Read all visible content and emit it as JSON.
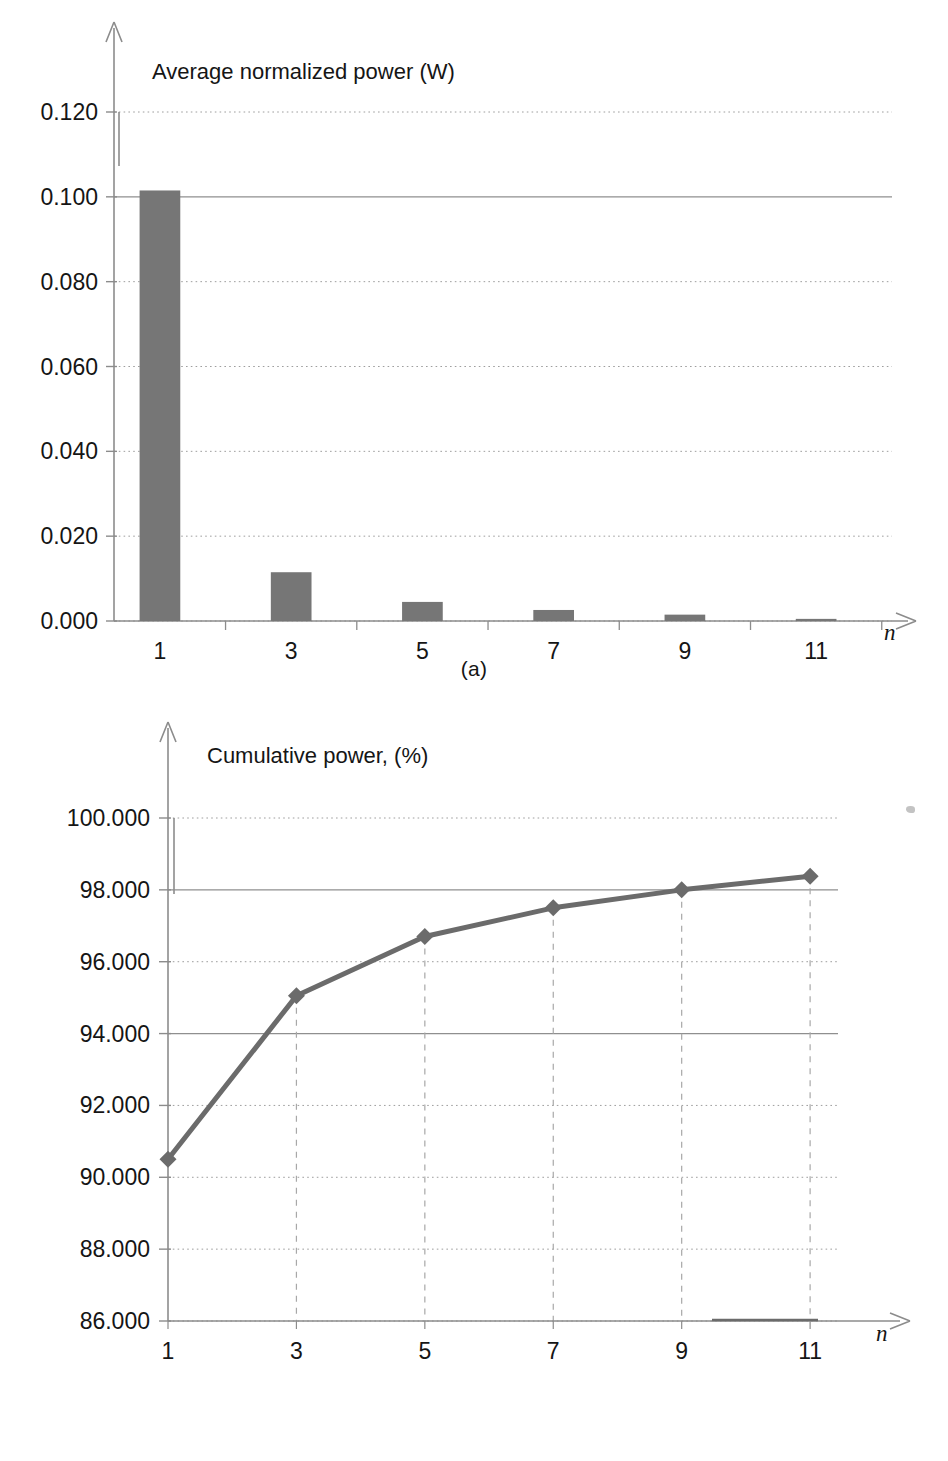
{
  "figure": {
    "panel_a_caption": "(a)",
    "panel_b_caption": "(b)",
    "bar_color": "#767676",
    "line_color": "#6b6b6b",
    "axis_color": "#8c8c8c",
    "grid_color": "#9a9a9a",
    "text_color": "#151515"
  },
  "chart_data": [
    {
      "id": "panel-a",
      "type": "bar",
      "title": "Average normalized power (W)",
      "xlabel": "n",
      "ylabel": "",
      "categories": [
        1,
        2,
        3,
        4,
        5,
        6,
        7,
        8,
        9,
        10,
        11
      ],
      "values": [
        0.1015,
        0.0,
        0.0115,
        0.0,
        0.0045,
        0.0,
        0.0026,
        0.0,
        0.0015,
        0.0,
        0.0005
      ],
      "xtick_labels": [
        "1",
        "3",
        "5",
        "7",
        "9",
        "11"
      ],
      "xtick_values": [
        1,
        3,
        5,
        7,
        9,
        11
      ],
      "ytick_labels": [
        "0.000",
        "0.020",
        "0.040",
        "0.060",
        "0.080",
        "0.100",
        "0.120"
      ],
      "ytick_values": [
        0.0,
        0.02,
        0.04,
        0.06,
        0.08,
        0.1,
        0.12
      ],
      "ylim": [
        0.0,
        0.132
      ],
      "xlim": [
        0.3,
        12.4
      ],
      "grid": true,
      "legend": "none",
      "caption": "(a)"
    },
    {
      "id": "panel-b",
      "type": "line",
      "title": "Cumulative power, (%)",
      "xlabel": "n",
      "ylabel": "",
      "x": [
        1,
        3,
        5,
        7,
        9,
        11
      ],
      "values": [
        90.5,
        95.05,
        96.7,
        97.5,
        98.0,
        98.38
      ],
      "marker": "diamond",
      "droplines": true,
      "xtick_labels": [
        "1",
        "3",
        "5",
        "7",
        "9",
        "11"
      ],
      "xtick_values": [
        1,
        3,
        5,
        7,
        9,
        11
      ],
      "ytick_labels": [
        "86.000",
        "88.000",
        "90.000",
        "92.000",
        "94.000",
        "96.000",
        "98.000",
        "100.000"
      ],
      "ytick_values": [
        86.0,
        88.0,
        90.0,
        92.0,
        94.0,
        96.0,
        98.0,
        100.0
      ],
      "ylim": [
        86.0,
        101.2
      ],
      "xlim": [
        1.0,
        12.4
      ],
      "grid": true,
      "legend": "none",
      "caption": "(b)"
    }
  ]
}
